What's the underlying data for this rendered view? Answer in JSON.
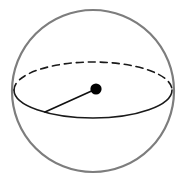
{
  "figure": {
    "type": "geometric-diagram",
    "width": 176,
    "height": 185,
    "background_color": "#ffffff"
  },
  "geometry": {
    "outer_circle": {
      "name": "sphere-outline",
      "cx": 93,
      "cy": 91,
      "r": 81,
      "stroke_color": "#7d7d7d",
      "stroke_width": 2.2,
      "fill": "none"
    },
    "equator_ellipse": {
      "name": "equator",
      "cx": 93,
      "cy": 90,
      "rx": 79,
      "ry": 28,
      "stroke_color": "#1a1a1a",
      "stroke_width": 1.6,
      "front_style": "solid",
      "back_style": "dashed",
      "dash_pattern": "7,5"
    },
    "center_point": {
      "name": "sphere-center",
      "cx": 96,
      "cy": 89,
      "r": 5.6,
      "fill_color": "#000000"
    },
    "radius_segment": {
      "name": "radius-line",
      "x1": 96,
      "y1": 89,
      "x2": 45,
      "y2": 112,
      "stroke_color": "#111111",
      "stroke_width": 1.7
    }
  }
}
